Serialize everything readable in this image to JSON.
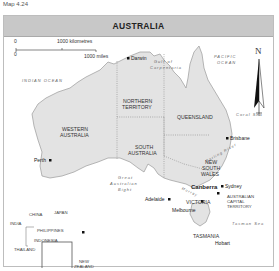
{
  "caption": "Map 4.24",
  "title": "AUSTRALIA",
  "scale": {
    "km_zero": "0",
    "km_label": "1000 kilometres",
    "mi_zero": "0",
    "mi_label": "1000 miles"
  },
  "compass": {
    "label": "N"
  },
  "oceans": {
    "indian": "INDIAN OCEAN",
    "pacific_line1": "PACIFIC",
    "pacific_line2": "OCEAN"
  },
  "seas": {
    "coral": "Coral Sea",
    "tasman": "Tasman Sea",
    "gulf_line1": "Gulf of",
    "gulf_line2": "Carpentaria",
    "bight_line1": "Great",
    "bight_line2": "Australian",
    "bight_line3": "Bight",
    "darling": "Darling River",
    "murray": "Murray"
  },
  "states": {
    "wa_line1": "WESTERN",
    "wa_line2": "AUSTRALIA",
    "nt_line1": "NORTHERN",
    "nt_line2": "TERRITORY",
    "qld": "QUEENSLAND",
    "sa_line1": "SOUTH",
    "sa_line2": "AUSTRALIA",
    "nsw_line1": "NEW",
    "nsw_line2": "SOUTH",
    "nsw_line3": "WALES",
    "vic": "VICTORIA",
    "tas": "TASMANIA",
    "act_line1": "AUSTRALIAN",
    "act_line2": "CAPITAL",
    "act_line3": "TERRITORY"
  },
  "cities": {
    "darwin": "Darwin",
    "brisbane": "Brisbane",
    "sydney": "Sydney",
    "canberra": "Canberra",
    "melbourne": "Melbourne",
    "adelaide": "Adelaide",
    "perth": "Perth",
    "hobart": "Hobart"
  },
  "inset": {
    "china": "CHINA",
    "japan": "JAPAN",
    "india": "INDIA",
    "philippines": "PHILIPPINES",
    "indonesia": "INDONESIA",
    "thailand": "THAILAND",
    "nz_line1": "NEW",
    "nz_line2": "ZEALAND"
  },
  "colors": {
    "land": "#e3e3e3",
    "water": "#ffffff",
    "header": "#c8c8c8",
    "border": "#9a9a9a"
  }
}
